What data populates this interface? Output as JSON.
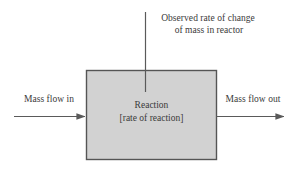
{
  "diagram": {
    "type": "process-block-diagram",
    "background_color": "#ffffff",
    "text_color": "#3a3a3a",
    "box": {
      "label_line1": "Reaction",
      "label_line2": "[rate of reaction]",
      "fill_color": "#d2d2d2",
      "border_color": "#555555"
    },
    "top_annotation": {
      "line1": "Observed rate of change",
      "line2": "of mass in reactor",
      "connector": "vertical-line"
    },
    "inflow": {
      "label": "Mass flow in",
      "arrow_direction": "right"
    },
    "outflow": {
      "label": "Mass flow out",
      "arrow_direction": "right"
    },
    "line_color": "#5a5a5a"
  }
}
